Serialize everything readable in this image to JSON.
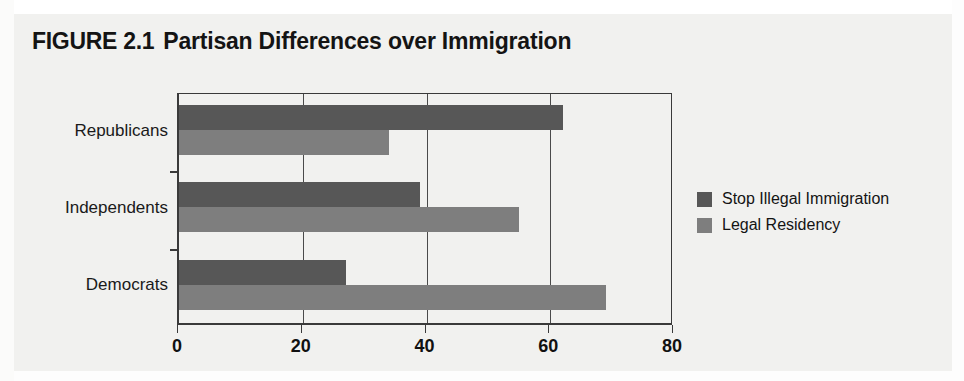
{
  "figure": {
    "label": "FIGURE 2.1",
    "caption": "Partisan Differences over Immigration",
    "full_title": "FIGURE 2.1 Partisan Differences over Immigration"
  },
  "legend": {
    "position": "right",
    "entries": [
      {
        "name": "Stop Illegal Immigration",
        "swatch_name": "legend-swatch-stop-illegal-immigration",
        "color": "#575757"
      },
      {
        "name": "Legal Residency",
        "swatch_name": "legend-swatch-legal-residency",
        "color": "#7e7e7e"
      }
    ]
  },
  "axis": {
    "x_ticks": [
      "0",
      "20",
      "40",
      "60",
      "80"
    ],
    "y_categories": [
      "Republicans",
      "Independents",
      "Democrats"
    ]
  },
  "chart_data": {
    "type": "bar",
    "orientation": "horizontal",
    "xlabel": "",
    "ylabel": "",
    "categories": [
      "Republicans",
      "Independents",
      "Democrats"
    ],
    "series": [
      {
        "name": "Stop Illegal Immigration",
        "color": "#575757",
        "values": [
          62,
          39,
          27
        ]
      },
      {
        "name": "Legal Residency",
        "color": "#7e7e7e",
        "values": [
          34,
          55,
          69
        ]
      }
    ],
    "xlim": [
      0,
      80
    ],
    "xticks": [
      0,
      20,
      40,
      60,
      80
    ],
    "grid": true,
    "grid_axis": "x",
    "legend_position": "right"
  }
}
